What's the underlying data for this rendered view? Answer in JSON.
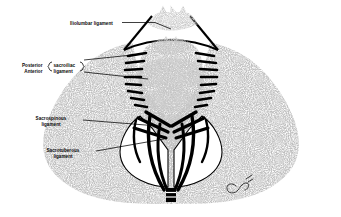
{
  "figure": {
    "style": "black-and-white stippled anatomical line drawing",
    "background_color": "#ffffff",
    "bone_fill_color": "#808080",
    "outline_color": "#000000",
    "label_color": "#0a0a0a",
    "signature": "Carol"
  },
  "labels": {
    "iliolumbar": "Iliolumbar ligament",
    "posterior": "Posterior",
    "anterior": "Anterior",
    "sacroiliac_line1": "sacroiliac",
    "sacroiliac_line2": "ligament",
    "sacrospinous_line1": "Sacrospinous",
    "sacrospinous_line2": "ligament",
    "sacrotuberous_line1": "Sacrotuberous",
    "sacrotuberous_line2": "ligament"
  },
  "structures": {
    "vertebra": "lumbar vertebra with spinous and transverse processes",
    "sacrum": "sacrum with segmented oval bodies",
    "coccyx": "coccyx",
    "ilium_left": "left iliac wing",
    "ilium_right": "right iliac wing",
    "interosseous_hatching": "interosseous sacroiliac ligament hatch marks"
  }
}
